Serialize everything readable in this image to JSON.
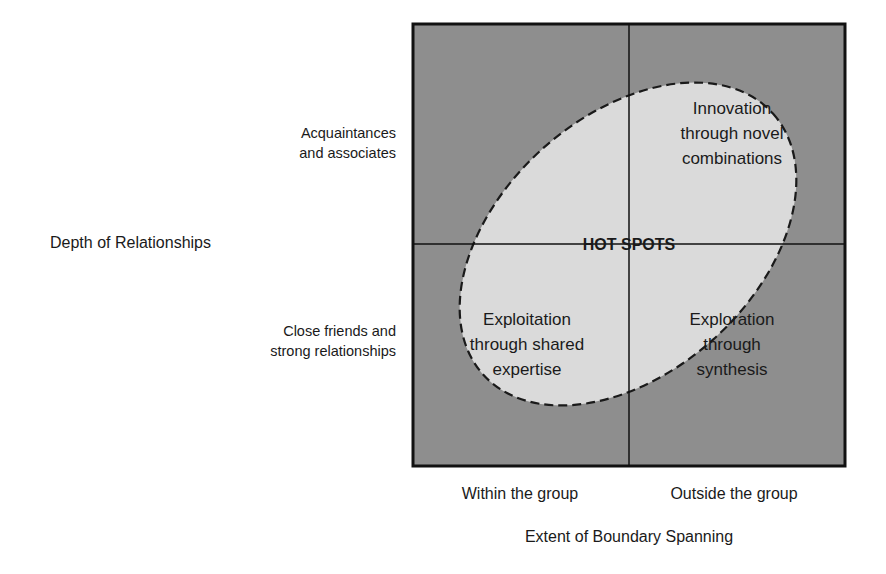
{
  "diagram": {
    "y_axis": {
      "title": "Depth of Relationships",
      "top_label": [
        "Acquaintances",
        "and associates"
      ],
      "bottom_label": [
        "Close friends and",
        "strong relationships"
      ]
    },
    "x_axis": {
      "title": "Extent of Boundary Spanning",
      "left_label": "Within the group",
      "right_label": "Outside the group"
    },
    "center_label": "HOT SPOTS",
    "quadrants": {
      "top_right": [
        "Innovation",
        "through novel",
        "combinations"
      ],
      "bottom_left": [
        "Exploitation",
        "through shared",
        "expertise"
      ],
      "bottom_right": [
        "Exploration",
        "through",
        "synthesis"
      ]
    },
    "colors": {
      "outer_fill": "#8e8e8e",
      "hotspot_fill": "#dadada",
      "line": "#111111"
    }
  }
}
